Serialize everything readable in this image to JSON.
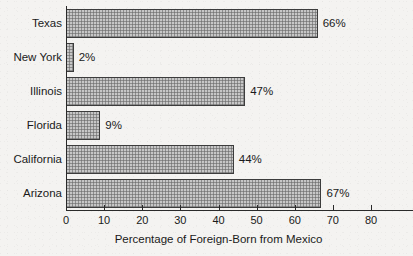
{
  "chart_data": {
    "type": "bar",
    "orientation": "horizontal",
    "title": "",
    "xlabel": "Percentage of Foreign-Born from Mexico",
    "ylabel": "",
    "categories": [
      "Texas",
      "New York",
      "Illinois",
      "Florida",
      "California",
      "Arizona"
    ],
    "values": [
      66,
      2,
      47,
      9,
      44,
      67
    ],
    "value_labels": [
      "66%",
      "2%",
      "47%",
      "9%",
      "44%",
      "67%"
    ],
    "xlim": [
      0,
      80
    ],
    "xticks": [
      0,
      10,
      20,
      30,
      40,
      50,
      60,
      70,
      80
    ],
    "xtick_labels": [
      "0",
      "10",
      "20",
      "30",
      "40",
      "50",
      "60",
      "70",
      "80"
    ],
    "grid": false,
    "legend": null,
    "bar_fill": "#8e8e8e",
    "bar_edge": "#3c3c3c",
    "background": "#f4f3f1",
    "note": "Rightmost tick label 80 is clipped by the image edge and renders as 8"
  }
}
